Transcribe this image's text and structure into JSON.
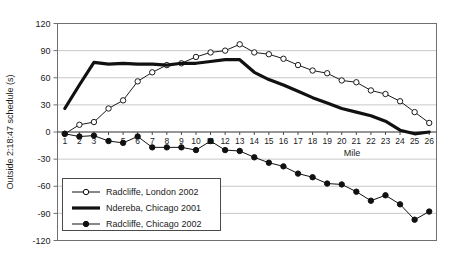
{
  "chart_data": {
    "type": "line",
    "title": "",
    "xlabel": "Mile",
    "ylabel": "Outside 2:18:47 schedule (s)",
    "xlim": [
      0.5,
      26.5
    ],
    "ylim": [
      -120,
      120
    ],
    "grid": true,
    "y_ticks": [
      120,
      90,
      60,
      30,
      0,
      -30,
      -60,
      -90,
      -120
    ],
    "x_ticks": [
      1,
      2,
      3,
      4,
      5,
      6,
      7,
      8,
      9,
      10,
      11,
      12,
      13,
      14,
      15,
      16,
      17,
      18,
      19,
      20,
      21,
      22,
      23,
      24,
      25,
      26
    ],
    "x": [
      1,
      2,
      3,
      4,
      5,
      6,
      7,
      8,
      9,
      10,
      11,
      12,
      13,
      14,
      15,
      16,
      17,
      18,
      19,
      20,
      21,
      22,
      23,
      24,
      25,
      26
    ],
    "legend_position": "lower-left-inside",
    "series": [
      {
        "name": "Radcliffe, London 2002",
        "marker": "open-circle",
        "line": "thin",
        "color": "#1b1b1b",
        "values": [
          -2,
          8,
          11,
          26,
          35,
          56,
          66,
          74,
          76,
          83,
          88,
          90,
          97,
          88,
          86,
          81,
          74,
          68,
          65,
          57,
          55,
          46,
          42,
          34,
          22,
          10
        ]
      },
      {
        "name": "Ndereba, Chicago 2001",
        "marker": "none",
        "line": "thick",
        "color": "#111111",
        "values": [
          26,
          52,
          77,
          75,
          76,
          75,
          75,
          74,
          76,
          76,
          78,
          80,
          80,
          66,
          58,
          52,
          45,
          38,
          32,
          26,
          22,
          18,
          12,
          2,
          -2,
          0
        ]
      },
      {
        "name": "Radcliffe, Chicago 2002",
        "marker": "filled-circle",
        "line": "thin",
        "color": "#111111",
        "values": [
          -2,
          -5,
          -4,
          -10,
          -12,
          -5,
          -17,
          -17,
          -17,
          -20,
          -10,
          -20,
          -21,
          -28,
          -34,
          -38,
          -46,
          -50,
          -57,
          -58,
          -66,
          -76,
          -70,
          -80,
          -97,
          -88
        ]
      }
    ]
  },
  "legend": {
    "items": [
      {
        "label": "Radcliffe, London 2002",
        "marker": "open-circle"
      },
      {
        "label": "Ndereba, Chicago 2001",
        "marker": "thick-line"
      },
      {
        "label": "Radcliffe, Chicago 2002",
        "marker": "filled-circle"
      }
    ]
  },
  "axes": {
    "y_title": "Outside 2:18:47 schedule (s)",
    "x_title": "Mile",
    "y_tick_labels": [
      "120",
      "90",
      "60",
      "30",
      "0",
      "-30",
      "-60",
      "-90",
      "-120"
    ],
    "x_tick_labels": [
      "1",
      "2",
      "3",
      "4",
      "5",
      "6",
      "7",
      "8",
      "9",
      "10",
      "11",
      "12",
      "13",
      "14",
      "15",
      "16",
      "17",
      "18",
      "19",
      "20",
      "21",
      "22",
      "23",
      "24",
      "25",
      "26"
    ]
  },
  "colors": {
    "axis": "#6f6f6f",
    "grid": "#c9c9c9",
    "text": "#1b1b1b",
    "series_line": "#111111",
    "marker_fill_open": "#ffffff",
    "marker_fill_solid": "#111111",
    "background": "#ffffff"
  }
}
